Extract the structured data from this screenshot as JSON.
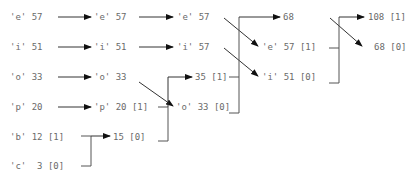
{
  "diagram": {
    "columns": [
      {
        "step": 1,
        "nodes": [
          {
            "id": "c1-e",
            "text": "'e' 57"
          },
          {
            "id": "c1-i",
            "text": "'i' 51"
          },
          {
            "id": "c1-o",
            "text": "'o' 33"
          },
          {
            "id": "c1-p",
            "text": "'p' 20"
          },
          {
            "id": "c1-b",
            "text": "'b' 12 [1]"
          },
          {
            "id": "c1-c",
            "text": "'c'  3 [0]"
          }
        ]
      },
      {
        "step": 2,
        "nodes": [
          {
            "id": "c2-e",
            "text": "'e' 57"
          },
          {
            "id": "c2-i",
            "text": "'i' 51"
          },
          {
            "id": "c2-o",
            "text": "'o' 33"
          },
          {
            "id": "c2-p",
            "text": "'p' 20 [1]"
          },
          {
            "id": "c2-15",
            "text": "15 [0]"
          }
        ]
      },
      {
        "step": 3,
        "nodes": [
          {
            "id": "c3-e",
            "text": "'e' 57"
          },
          {
            "id": "c3-i",
            "text": "'i' 57"
          },
          {
            "id": "c3-35",
            "text": "35 [1]"
          },
          {
            "id": "c3-o",
            "text": "'o' 33 [0]"
          }
        ]
      },
      {
        "step": 4,
        "nodes": [
          {
            "id": "c4-68",
            "text": "68"
          },
          {
            "id": "c4-e",
            "text": "'e' 57 [1]"
          },
          {
            "id": "c4-i",
            "text": "'i' 51 [0]"
          }
        ]
      },
      {
        "step": 5,
        "nodes": [
          {
            "id": "c5-108",
            "text": "108 [1]"
          },
          {
            "id": "c5-68",
            "text": "68 [0]"
          }
        ]
      }
    ],
    "colors": {
      "text": "#6a6a6a",
      "line": "#555555",
      "arrow": "#111111"
    }
  }
}
